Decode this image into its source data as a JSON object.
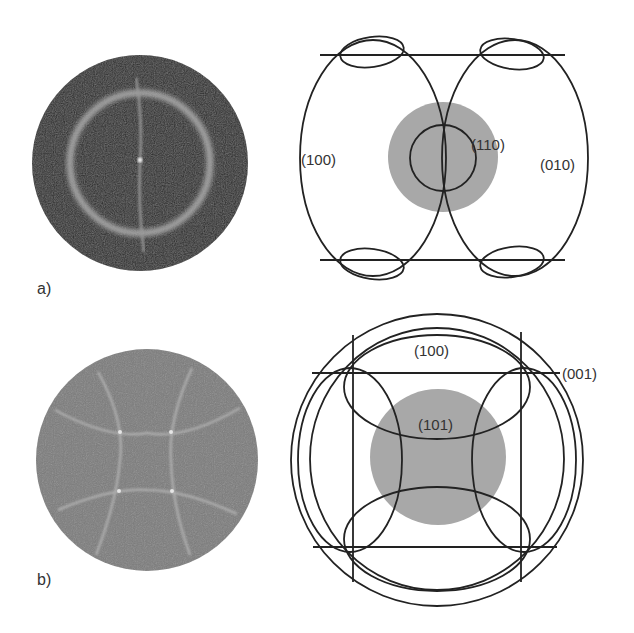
{
  "figure": {
    "panel_a": {
      "label": "a)",
      "pattern": {
        "background": "#2a2a2a",
        "ring_color": "#b8b8b8"
      },
      "schematic": {
        "labels": {
          "left": "(100)",
          "center": "(110)",
          "right": "(010)"
        },
        "disc_color": "#a8a8a8"
      }
    },
    "panel_b": {
      "label": "b)",
      "pattern": {
        "background": "#7a7a7a",
        "line_color": "#b0b0b0"
      },
      "schematic": {
        "labels": {
          "top": "(100)",
          "right": "(001)",
          "center": "(101)"
        },
        "disc_color": "#a8a8a8"
      }
    }
  }
}
